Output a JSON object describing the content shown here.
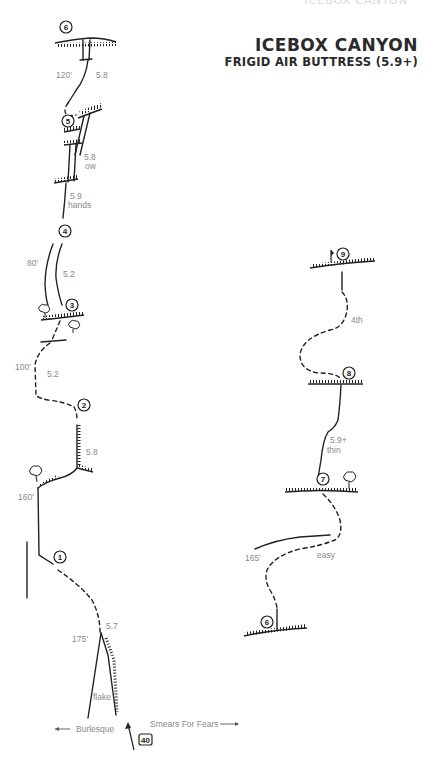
{
  "header": {
    "faint_running_head": "ICEBOX CANYON",
    "title": "ICEBOX CANYON",
    "subtitle": "FRIGID AIR BUTTRESS (5.9+)"
  },
  "left_column": {
    "belays": [
      {
        "num": "1"
      },
      {
        "num": "2"
      },
      {
        "num": "3"
      },
      {
        "num": "4"
      },
      {
        "num": "5"
      },
      {
        "num": "6"
      }
    ],
    "pitch_labels": {
      "p6_length": "120'",
      "p6_grade": "5.8",
      "p5_grade": "5.8",
      "p5_note": "ow",
      "p4_grade": "5.9",
      "p4_note": "hands",
      "p3_length": "80'",
      "p3_grade": "5.2",
      "p2_length": "100'",
      "p2_grade": "5.2",
      "p2_crack_grade": "5.8",
      "p1_length": "160'",
      "p0_length": "175'",
      "p0_grade": "5.7",
      "p0_note": "flake"
    },
    "neighbors": {
      "left_route": "Burlesque",
      "right_route": "Smears For Fears",
      "left_arrow": "←",
      "right_arrow": "→"
    },
    "start_marker": "40"
  },
  "right_column": {
    "belays": [
      {
        "num": "6"
      },
      {
        "num": "7"
      },
      {
        "num": "8"
      },
      {
        "num": "9"
      }
    ],
    "pitch_labels": {
      "p9_grade": "4th",
      "p8_grade": "5.9+",
      "p8_note": "thin",
      "p7_length": "165'",
      "p7_grade": "easy"
    }
  }
}
